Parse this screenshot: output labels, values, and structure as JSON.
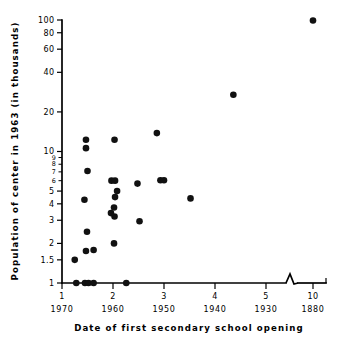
{
  "chart_data": {
    "type": "scatter",
    "title": "",
    "xlabel": "Date of first secondary school opening",
    "ylabel": "Population of center in 1963 (in thousands)",
    "yscale": "log",
    "ylim": [
      1,
      100
    ],
    "xlim": [
      1,
      10
    ],
    "grid": false,
    "legend": null,
    "y_ticks": [
      {
        "value": 100,
        "label": "100"
      },
      {
        "value": 80,
        "label": "80"
      },
      {
        "value": 60,
        "label": "60"
      },
      {
        "value": 40,
        "label": "40"
      },
      {
        "value": 20,
        "label": "20"
      },
      {
        "value": 10,
        "label": "10"
      },
      {
        "value": 9,
        "label": "9"
      },
      {
        "value": 8,
        "label": "8"
      },
      {
        "value": 7,
        "label": "7"
      },
      {
        "value": 6,
        "label": "6"
      },
      {
        "value": 5,
        "label": "5"
      },
      {
        "value": 4,
        "label": "4"
      },
      {
        "value": 3,
        "label": "3"
      },
      {
        "value": 2,
        "label": "2"
      },
      {
        "value": 1.5,
        "label": "1.5"
      },
      {
        "value": 1,
        "label": "1"
      }
    ],
    "x_ticks": [
      {
        "value": 1,
        "label": "1",
        "year": "1970"
      },
      {
        "value": 2,
        "label": "2",
        "year": "1960"
      },
      {
        "value": 3,
        "label": "3",
        "year": "1950"
      },
      {
        "value": 4,
        "label": "4",
        "year": "1940"
      },
      {
        "value": 5,
        "label": "5",
        "year": "1930"
      },
      {
        "value": 10,
        "label": "10",
        "year": "1880"
      }
    ],
    "axis_break": {
      "present": true,
      "between": [
        5,
        10
      ],
      "axis": "x"
    },
    "points": [
      {
        "x": 1.28,
        "y": 1.0
      },
      {
        "x": 1.45,
        "y": 1.0
      },
      {
        "x": 1.52,
        "y": 1.0
      },
      {
        "x": 1.62,
        "y": 1.0
      },
      {
        "x": 2.26,
        "y": 1.0
      },
      {
        "x": 1.25,
        "y": 1.5
      },
      {
        "x": 1.47,
        "y": 1.75
      },
      {
        "x": 1.62,
        "y": 1.78
      },
      {
        "x": 2.02,
        "y": 2.0
      },
      {
        "x": 1.49,
        "y": 2.45
      },
      {
        "x": 2.52,
        "y": 2.95
      },
      {
        "x": 2.03,
        "y": 3.2
      },
      {
        "x": 1.96,
        "y": 3.4
      },
      {
        "x": 2.02,
        "y": 3.75
      },
      {
        "x": 1.44,
        "y": 4.3
      },
      {
        "x": 3.52,
        "y": 4.4
      },
      {
        "x": 2.04,
        "y": 4.5
      },
      {
        "x": 2.08,
        "y": 5.0
      },
      {
        "x": 2.48,
        "y": 5.7
      },
      {
        "x": 1.97,
        "y": 6.0
      },
      {
        "x": 2.04,
        "y": 6.0
      },
      {
        "x": 2.93,
        "y": 6.05
      },
      {
        "x": 3.0,
        "y": 6.05
      },
      {
        "x": 1.5,
        "y": 7.1
      },
      {
        "x": 1.47,
        "y": 10.6
      },
      {
        "x": 1.47,
        "y": 12.3
      },
      {
        "x": 2.03,
        "y": 12.3
      },
      {
        "x": 2.86,
        "y": 13.8
      },
      {
        "x": 4.36,
        "y": 27.0
      },
      {
        "x": 10.0,
        "y": 99.0
      }
    ]
  }
}
